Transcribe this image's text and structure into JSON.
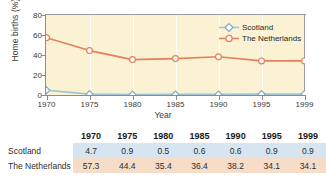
{
  "chart_data": {
    "type": "line",
    "title": "",
    "xlabel": "Year",
    "ylabel": "Home births (%)",
    "categories": [
      "1970",
      "1975",
      "1980",
      "1985",
      "1990",
      "1995",
      "1999"
    ],
    "x": [
      1970,
      1975,
      1980,
      1985,
      1990,
      1995,
      1999
    ],
    "ylim": [
      0,
      80
    ],
    "yticks": [
      0,
      20,
      40,
      60,
      80
    ],
    "grid": "vertical-white-gridlines",
    "legend_position": "top-right-inside",
    "series": [
      {
        "name": "Scotland",
        "values": [
          4.7,
          0.9,
          0.5,
          0.6,
          0.6,
          0.9,
          0.9
        ],
        "color": "#9fc4d8",
        "marker": "diamond"
      },
      {
        "name": "The Netherlands",
        "values": [
          57.3,
          44.4,
          35.4,
          36.4,
          38.2,
          34.1,
          34.1
        ],
        "color": "#e4815a",
        "marker": "circle"
      }
    ],
    "plot_background": "#fbf2d3"
  },
  "legend": {
    "items": [
      {
        "label": "Scotland"
      },
      {
        "label": "The Netherlands"
      }
    ]
  },
  "axis": {
    "y_label": "Home births (%)",
    "x_label": "Year",
    "y_ticks": [
      "0",
      "20",
      "40",
      "60",
      "80"
    ],
    "x_ticks": [
      "1970",
      "1975",
      "1980",
      "1985",
      "1990",
      "1995",
      "1999"
    ]
  },
  "table": {
    "corner_label": "",
    "columns": [
      "1970",
      "1975",
      "1980",
      "1985",
      "1990",
      "1995",
      "1999"
    ],
    "rows": [
      {
        "label": "Scotland",
        "values": [
          "4.7",
          "0.9",
          "0.5",
          "0.6",
          "0.6",
          "0.9",
          "0.9"
        ]
      },
      {
        "label": "The Netherlands",
        "values": [
          "57.3",
          "44.4",
          "35.4",
          "36.4",
          "38.2",
          "34.1",
          "34.1"
        ]
      }
    ]
  },
  "colors": {
    "scotland": "#9fc4d8",
    "netherlands": "#e4815a",
    "plot_bg": "#fbf2d3",
    "scotland_band": "#d7e5f0",
    "netherlands_band": "#f7dcc8"
  }
}
